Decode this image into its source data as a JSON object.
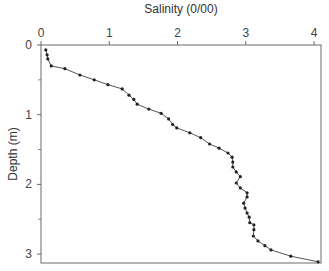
{
  "chart_data": {
    "type": "line",
    "title": "",
    "xlabel": "Salinity (0/00)",
    "ylabel": "Depth (m)",
    "x_axis_position": "top",
    "y_axis_inverted": true,
    "xlim": [
      0,
      4
    ],
    "ylim": [
      0,
      3.13
    ],
    "x_ticks": [
      "0",
      "1",
      "2",
      "3",
      "4"
    ],
    "y_ticks": [
      "0",
      "1",
      "2",
      "3"
    ],
    "y_minor_ticks": [
      0.5,
      1.5,
      2.5
    ],
    "grid": false,
    "legend": null,
    "series": [
      {
        "name": "Salinity profile",
        "marker": "circle",
        "points": [
          {
            "x": 0.07,
            "depth": 0.07
          },
          {
            "x": 0.09,
            "depth": 0.14
          },
          {
            "x": 0.1,
            "depth": 0.2
          },
          {
            "x": 0.15,
            "depth": 0.3
          },
          {
            "x": 0.35,
            "depth": 0.34
          },
          {
            "x": 0.57,
            "depth": 0.43
          },
          {
            "x": 0.78,
            "depth": 0.5
          },
          {
            "x": 0.98,
            "depth": 0.57
          },
          {
            "x": 1.19,
            "depth": 0.63
          },
          {
            "x": 1.29,
            "depth": 0.72
          },
          {
            "x": 1.36,
            "depth": 0.78
          },
          {
            "x": 1.41,
            "depth": 0.85
          },
          {
            "x": 1.58,
            "depth": 0.92
          },
          {
            "x": 1.76,
            "depth": 0.98
          },
          {
            "x": 1.87,
            "depth": 1.06
          },
          {
            "x": 1.93,
            "depth": 1.14
          },
          {
            "x": 1.99,
            "depth": 1.19
          },
          {
            "x": 2.18,
            "depth": 1.26
          },
          {
            "x": 2.34,
            "depth": 1.33
          },
          {
            "x": 2.47,
            "depth": 1.42
          },
          {
            "x": 2.61,
            "depth": 1.48
          },
          {
            "x": 2.74,
            "depth": 1.55
          },
          {
            "x": 2.8,
            "depth": 1.61
          },
          {
            "x": 2.81,
            "depth": 1.68
          },
          {
            "x": 2.81,
            "depth": 1.75
          },
          {
            "x": 2.86,
            "depth": 1.82
          },
          {
            "x": 2.92,
            "depth": 1.89
          },
          {
            "x": 2.86,
            "depth": 1.98
          },
          {
            "x": 2.92,
            "depth": 2.05
          },
          {
            "x": 3.02,
            "depth": 2.12
          },
          {
            "x": 3.02,
            "depth": 2.18
          },
          {
            "x": 2.97,
            "depth": 2.27
          },
          {
            "x": 2.99,
            "depth": 2.34
          },
          {
            "x": 3.02,
            "depth": 2.41
          },
          {
            "x": 3.05,
            "depth": 2.47
          },
          {
            "x": 3.06,
            "depth": 2.55
          },
          {
            "x": 3.12,
            "depth": 2.58
          },
          {
            "x": 3.12,
            "depth": 2.65
          },
          {
            "x": 3.11,
            "depth": 2.74
          },
          {
            "x": 3.18,
            "depth": 2.81
          },
          {
            "x": 3.28,
            "depth": 2.88
          },
          {
            "x": 3.37,
            "depth": 2.94
          },
          {
            "x": 3.66,
            "depth": 3.03
          },
          {
            "x": 4.06,
            "depth": 3.11
          }
        ]
      }
    ]
  }
}
